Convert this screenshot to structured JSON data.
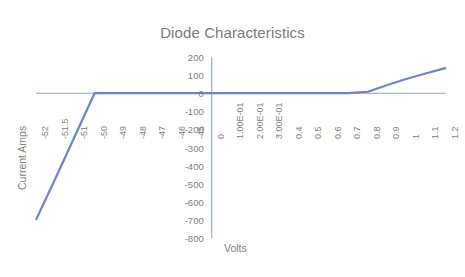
{
  "chart_data": {
    "type": "line",
    "title": "Diode Characteristics",
    "xlabel": "Volts",
    "ylabel": "Current Amps",
    "grid": false,
    "legend": "none",
    "ylim": [
      -800,
      200
    ],
    "yticks": [
      200,
      100,
      0,
      -100,
      -200,
      -300,
      -400,
      -500,
      -600,
      -700,
      -800
    ],
    "ytick_labels": [
      "200",
      "100",
      "0",
      "-100",
      "-200",
      "-300",
      "-400",
      "-500",
      "-600",
      "-700",
      "-800"
    ],
    "categories": [
      "-52",
      "-51.5",
      "-51",
      "-50",
      "-49",
      "-48",
      "-47",
      "-46",
      "-45",
      "0",
      "1.00E-01",
      "2.00E-01",
      "3.00E-01",
      "0.4",
      "0.5",
      "0.6",
      "0.7",
      "0.8",
      "0.9",
      "1",
      "1.1",
      "1.2"
    ],
    "x": [
      -52,
      -51.5,
      -51,
      -50,
      -49,
      -48,
      -47,
      -46,
      -45,
      0,
      0.1,
      0.2,
      0.3,
      0.4,
      0.5,
      0.6,
      0.7,
      0.8,
      0.9,
      1,
      1.1,
      1.2
    ],
    "series": [
      {
        "name": "Diode current",
        "color": "#6a86c4",
        "values": [
          -700,
          -470,
          -235,
          0,
          0,
          0,
          0,
          0,
          0,
          0,
          0,
          0,
          0,
          0,
          0,
          0,
          0,
          8,
          45,
          80,
          110,
          140
        ]
      }
    ],
    "annotations": [
      "Reverse breakdown near -50 V",
      "Forward conduction begins near 0.8 V"
    ]
  },
  "axis": {
    "y_title": "Current Amps",
    "x_title": "Volts"
  }
}
